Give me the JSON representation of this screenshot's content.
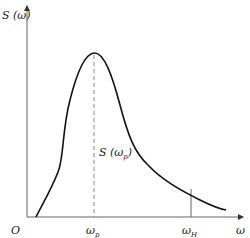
{
  "diagram": {
    "type": "spectrum-curve",
    "y_axis_label": "S (ω)",
    "x_axis_label": "ω",
    "origin_label": "O",
    "peak_label": "S (ω",
    "peak_label_sub": "p",
    "peak_label_close": ")",
    "tick_p_main": "ω",
    "tick_p_sub": "p",
    "tick_h_main": "ω",
    "tick_h_sub": "H",
    "colors": {
      "curve": "#111111",
      "axis": "#555555",
      "dashed": "#888888"
    }
  }
}
